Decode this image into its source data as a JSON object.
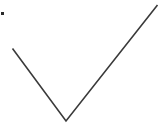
{
  "icon": {
    "name": "checkmark-icon",
    "stroke_color": "#3a3a3a",
    "marker_color": "#2a2a2a"
  },
  "background_color": "#ffffff"
}
